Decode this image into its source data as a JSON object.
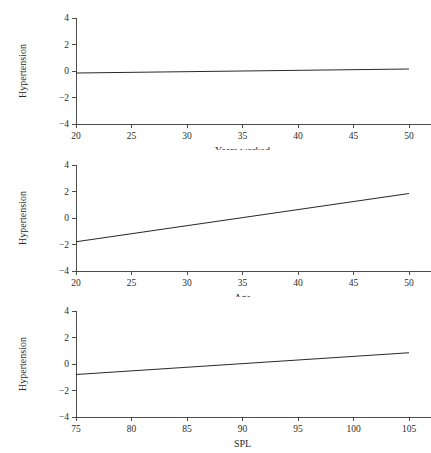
{
  "chart_data": [
    {
      "type": "line",
      "title": "",
      "xlabel": "Years worked",
      "ylabel": "Hypertension",
      "xlim": [
        20,
        50
      ],
      "ylim": [
        -4,
        4
      ],
      "xticks": [
        20,
        25,
        30,
        35,
        40,
        45,
        50
      ],
      "xticklabels": [
        "20",
        "25",
        "30",
        "35",
        "40",
        "45",
        "50"
      ],
      "yticks": [
        4,
        2,
        0,
        -2,
        -4
      ],
      "yticklabels": [
        "4",
        "2",
        "0",
        "−2",
        "−4"
      ],
      "grid": false,
      "legend": false,
      "series": [
        {
          "name": "Hypertension vs Years worked",
          "x": [
            20,
            50
          ],
          "values": [
            -0.15,
            0.15
          ]
        }
      ]
    },
    {
      "type": "line",
      "title": "",
      "xlabel": "Age",
      "ylabel": "Hypertension",
      "xlim": [
        20,
        50
      ],
      "ylim": [
        -4,
        4
      ],
      "xticks": [
        20,
        25,
        30,
        35,
        40,
        45,
        50
      ],
      "xticklabels": [
        "20",
        "25",
        "30",
        "35",
        "40",
        "45",
        "50"
      ],
      "yticks": [
        4,
        2,
        0,
        -2,
        -4
      ],
      "yticklabels": [
        "4",
        "2",
        "0",
        "−2",
        "−4"
      ],
      "grid": false,
      "legend": false,
      "series": [
        {
          "name": "Hypertension vs Age",
          "x": [
            20,
            50
          ],
          "values": [
            -1.8,
            1.85
          ]
        }
      ]
    },
    {
      "type": "line",
      "title": "",
      "xlabel": "SPL",
      "ylabel": "Hypertension",
      "xlim": [
        75,
        105
      ],
      "ylim": [
        -4,
        4
      ],
      "xticks": [
        75,
        80,
        85,
        90,
        95,
        100,
        105
      ],
      "xticklabels": [
        "75",
        "80",
        "85",
        "90",
        "95",
        "100",
        "105"
      ],
      "yticks": [
        4,
        2,
        0,
        -2,
        -4
      ],
      "yticklabels": [
        "4",
        "2",
        "0",
        "−2",
        "−4"
      ],
      "grid": false,
      "legend": false,
      "series": [
        {
          "name": "Hypertension vs SPL",
          "x": [
            75,
            105
          ],
          "values": [
            -0.8,
            0.85
          ]
        }
      ]
    }
  ],
  "figure": {
    "background_color": "#ffffff",
    "line_color": "#2a2a2a",
    "axis_color": "#3a3a3a",
    "panel_count": 3
  }
}
